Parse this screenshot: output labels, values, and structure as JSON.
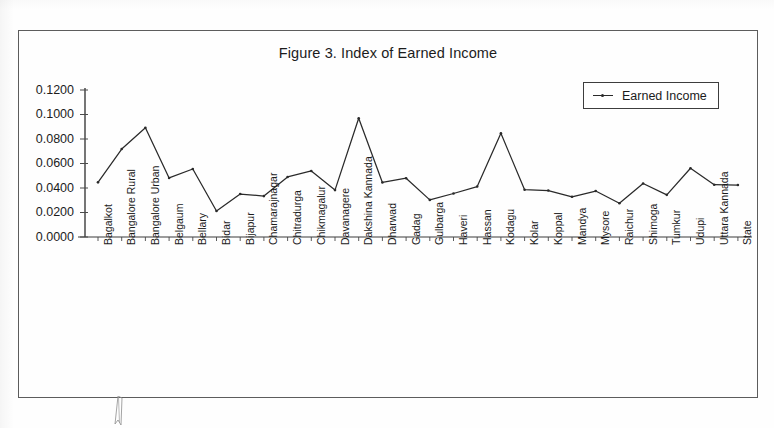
{
  "figure": {
    "title": "Figure 3. Index of Earned Income",
    "legend_label": "Earned Income",
    "line_color": "#2a2a2a",
    "frame_color": "#5c5c5c"
  },
  "chart_data": {
    "type": "line",
    "title": "Figure 3. Index of Earned Income",
    "xlabel": "",
    "ylabel": "",
    "ylim": [
      0.0,
      0.12
    ],
    "yticks": [
      0.0,
      0.02,
      0.04,
      0.06,
      0.08,
      0.1,
      0.12
    ],
    "ytick_labels": [
      "0.0000",
      "0.0200",
      "0.0400",
      "0.0600",
      "0.0800",
      "0.1000",
      "0.1200"
    ],
    "grid": false,
    "legend_position": "top-right",
    "legend": [
      "Earned Income"
    ],
    "categories": [
      "Bagalkot",
      "Bangalore Rural",
      "Bangalore Urban",
      "Belgaum",
      "Bellary",
      "Bidar",
      "Bijapur",
      "Chamarajnagar",
      "Chitradurga",
      "Chikmagalur",
      "Davanagere",
      "Dakshina Kannada",
      "Dharwad",
      "Gadag",
      "Gulbarga",
      "Haveri",
      "Hassan",
      "Kodagu",
      "Kolar",
      "Koppal",
      "Mandya",
      "Mysore",
      "Raichur",
      "Shimoga",
      "Tumkur",
      "Udupi",
      "Uttara Kannada",
      "State"
    ],
    "series": [
      {
        "name": "Earned Income",
        "values": [
          0.0446,
          0.0718,
          0.0892,
          0.0482,
          0.0555,
          0.0212,
          0.0351,
          0.0334,
          0.049,
          0.0539,
          0.0383,
          0.0969,
          0.0445,
          0.048,
          0.0303,
          0.0355,
          0.0412,
          0.0846,
          0.0386,
          0.0379,
          0.0328,
          0.0375,
          0.0276,
          0.0437,
          0.0344,
          0.0561,
          0.0427,
          0.0424
        ]
      }
    ]
  }
}
